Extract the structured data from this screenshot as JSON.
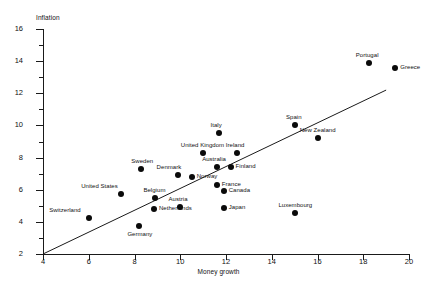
{
  "chart_data": {
    "type": "scatter",
    "title": "",
    "xlabel": "Money growth",
    "ylabel": "Inflation",
    "xlim": [
      4,
      20
    ],
    "ylim": [
      2,
      16
    ],
    "xticks": [
      4,
      6,
      8,
      10,
      12,
      14,
      16,
      18,
      20
    ],
    "yticks": [
      2,
      4,
      6,
      8,
      10,
      12,
      14,
      16
    ],
    "yticks_minor": [
      3,
      5,
      7,
      9,
      11,
      13,
      15
    ],
    "grid": false,
    "legend": "none",
    "trendline": {
      "x0": 4.0,
      "y0": 2.0,
      "x1": 19.0,
      "y1": 12.2
    },
    "points": [
      {
        "label": "Switzerland",
        "x": 6.0,
        "y": 4.25,
        "label_pos": "left"
      },
      {
        "label": "United States",
        "x": 7.4,
        "y": 5.75,
        "label_pos": "topleft"
      },
      {
        "label": "Sweden",
        "x": 8.3,
        "y": 7.3,
        "label_pos": "top"
      },
      {
        "label": "Germany",
        "x": 8.2,
        "y": 3.75,
        "label_pos": "bottom"
      },
      {
        "label": "Belgium",
        "x": 8.9,
        "y": 5.5,
        "label_pos": "top"
      },
      {
        "label": "Netherlands",
        "x": 8.85,
        "y": 4.8,
        "label_pos": "right"
      },
      {
        "label": "Denmark",
        "x": 9.9,
        "y": 6.9,
        "label_pos": "topleft"
      },
      {
        "label": "Austria",
        "x": 10.0,
        "y": 4.9,
        "label_pos": "top"
      },
      {
        "label": "Norway",
        "x": 10.5,
        "y": 6.8,
        "label_pos": "right"
      },
      {
        "label": "United Kingdom",
        "x": 11.0,
        "y": 8.3,
        "label_pos": "top"
      },
      {
        "label": "Italy",
        "x": 11.7,
        "y": 9.5,
        "label_pos": "top"
      },
      {
        "label": "Australia",
        "x": 11.6,
        "y": 7.4,
        "label_pos": "top"
      },
      {
        "label": "France",
        "x": 11.6,
        "y": 6.3,
        "label_pos": "right"
      },
      {
        "label": "Canada",
        "x": 11.9,
        "y": 5.9,
        "label_pos": "right"
      },
      {
        "label": "Japan",
        "x": 11.9,
        "y": 4.85,
        "label_pos": "right"
      },
      {
        "label": "Finland",
        "x": 12.2,
        "y": 7.4,
        "label_pos": "right"
      },
      {
        "label": "Ireland",
        "x": 12.5,
        "y": 8.3,
        "label_pos": "top"
      },
      {
        "label": "Luxembourg",
        "x": 15.0,
        "y": 4.55,
        "label_pos": "top"
      },
      {
        "label": "Spain",
        "x": 15.0,
        "y": 10.0,
        "label_pos": "top"
      },
      {
        "label": "New Zealand",
        "x": 16.0,
        "y": 9.2,
        "label_pos": "top"
      },
      {
        "label": "Portugal",
        "x": 18.25,
        "y": 13.9,
        "label_pos": "top"
      },
      {
        "label": "Greece",
        "x": 19.4,
        "y": 13.6,
        "label_pos": "right"
      }
    ]
  },
  "axes": {
    "y_title": "Inflation",
    "x_title": "Money growth",
    "y_tick_labels": [
      "16",
      "14",
      "12",
      "10",
      "8",
      "6",
      "4",
      "2"
    ],
    "x_tick_labels": [
      "4",
      "6",
      "8",
      "10",
      "12",
      "14",
      "16",
      "18",
      "20"
    ]
  },
  "colors": {
    "axis": "#1a1a1a",
    "marker": "#0a0a0a",
    "text": "#111111",
    "background": "#ffffff"
  }
}
